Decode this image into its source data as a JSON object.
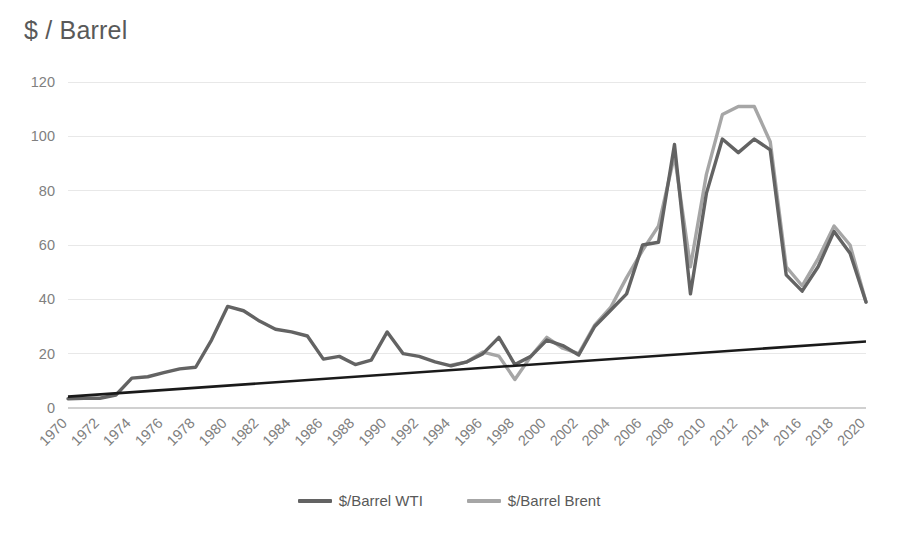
{
  "chart": {
    "title": "$ / Barrel",
    "legend_position": "bottom"
  },
  "legend": [
    {
      "label": "$/Barrel WTI",
      "color": "#636363"
    },
    {
      "label": "$/Barrel Brent",
      "color": "#a6a6a6"
    },
    {
      "label": "Trendline",
      "color": "#1a1a1a"
    }
  ],
  "axes": {
    "y_ticks": [
      "0",
      "20",
      "40",
      "60",
      "80",
      "100",
      "120"
    ],
    "x_ticks": [
      "1970",
      "1972",
      "1974",
      "1976",
      "1978",
      "1980",
      "1982",
      "1984",
      "1986",
      "1988",
      "1990",
      "1992",
      "1994",
      "1996",
      "1998",
      "2000",
      "2002",
      "2004",
      "2006",
      "2008",
      "2010",
      "2012",
      "2014",
      "2016",
      "2018",
      "2020"
    ]
  },
  "chart_data": {
    "type": "line",
    "title": "$ / Barrel",
    "xlabel": "",
    "ylabel": "$ / Barrel",
    "ylim": [
      0,
      120
    ],
    "xlim": [
      1970,
      2020
    ],
    "ytick_values": [
      0,
      20,
      40,
      60,
      80,
      100,
      120
    ],
    "xtick_values": [
      1970,
      1972,
      1974,
      1976,
      1978,
      1980,
      1982,
      1984,
      1986,
      1988,
      1990,
      1992,
      1994,
      1996,
      1998,
      2000,
      2002,
      2004,
      2006,
      2008,
      2010,
      2012,
      2014,
      2016,
      2018,
      2020
    ],
    "grid": true,
    "legend_position": "bottom",
    "x": [
      1970,
      1971,
      1972,
      1973,
      1974,
      1975,
      1976,
      1977,
      1978,
      1979,
      1980,
      1981,
      1982,
      1983,
      1984,
      1985,
      1986,
      1987,
      1988,
      1989,
      1990,
      1991,
      1992,
      1993,
      1994,
      1995,
      1996,
      1997,
      1998,
      1999,
      2000,
      2001,
      2002,
      2003,
      2004,
      2005,
      2006,
      2007,
      2008,
      2009,
      2010,
      2011,
      2012,
      2013,
      2014,
      2015,
      2016,
      2017,
      2018,
      2019,
      2020
    ],
    "series": [
      {
        "name": "$/Barrel WTI",
        "color": "#636363",
        "values": [
          3.4,
          3.6,
          3.6,
          4.8,
          11.0,
          11.5,
          13.0,
          14.4,
          15.0,
          25.1,
          37.4,
          35.8,
          32.0,
          29.0,
          28.0,
          26.5,
          18.0,
          19.0,
          16.0,
          17.6,
          28.0,
          20.0,
          19.0,
          17.0,
          15.5,
          17.0,
          20.0,
          26.0,
          16.0,
          19.0,
          25.0,
          23.0,
          19.5,
          30.0,
          36.0,
          42.0,
          60.0,
          61.0,
          97.0,
          42.0,
          79.0,
          99.0,
          94.0,
          99.0,
          95.0,
          49.0,
          43.0,
          52.0,
          65.0,
          57.0,
          39.0
        ]
      },
      {
        "name": "$/Barrel Brent",
        "color": "#a6a6a6",
        "values": [
          null,
          null,
          null,
          null,
          null,
          null,
          null,
          null,
          null,
          null,
          null,
          null,
          null,
          null,
          null,
          null,
          null,
          null,
          null,
          null,
          null,
          null,
          null,
          null,
          15.8,
          17.0,
          20.6,
          19.1,
          10.5,
          19.0,
          26.0,
          22.0,
          20.0,
          30.5,
          37.0,
          48.0,
          58.0,
          67.0,
          93.0,
          52.0,
          86.0,
          108.0,
          111.0,
          111.0,
          98.0,
          52.0,
          45.0,
          55.0,
          67.0,
          60.0,
          39.0
        ]
      }
    ],
    "trendline": {
      "name": "Trendline",
      "color": "#1a1a1a",
      "x": [
        1970,
        2020
      ],
      "y": [
        4.2,
        24.5
      ]
    }
  }
}
